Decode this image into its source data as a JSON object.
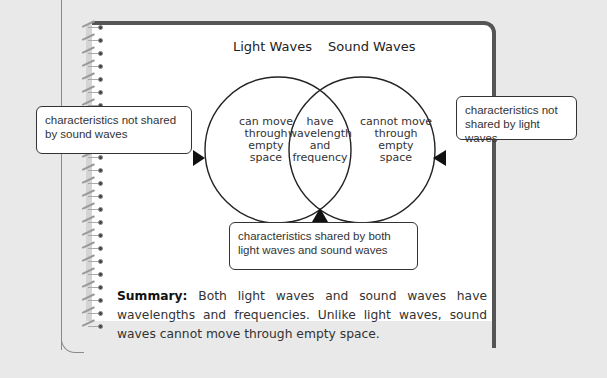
{
  "diagram": {
    "type": "venn",
    "sets": [
      {
        "label": "Light Waves",
        "unique": "can move through empty space"
      },
      {
        "label": "Sound Waves",
        "unique": "cannot move through empty space"
      }
    ],
    "overlap": "have wavelength and frequency",
    "region_lines": {
      "left": [
        "can move",
        "through empty",
        "space"
      ],
      "center": [
        "have",
        "wavelength",
        "and",
        "frequency"
      ],
      "right": [
        "cannot move",
        "through empty",
        "space"
      ]
    }
  },
  "callouts": {
    "left": "characteristics not shared by sound waves",
    "right": "characteristics not shared by light waves",
    "bottom": "characteristics shared by both light waves and sound waves"
  },
  "summary": {
    "label": "Summary:",
    "text": "Both light waves and sound waves have wavelengths and frequencies. Unlike light waves, sound waves cannot move through empty space."
  },
  "colors": {
    "background": "#e9e9e9",
    "page": "#ffffff",
    "border": "#555555",
    "ink": "#222222"
  }
}
